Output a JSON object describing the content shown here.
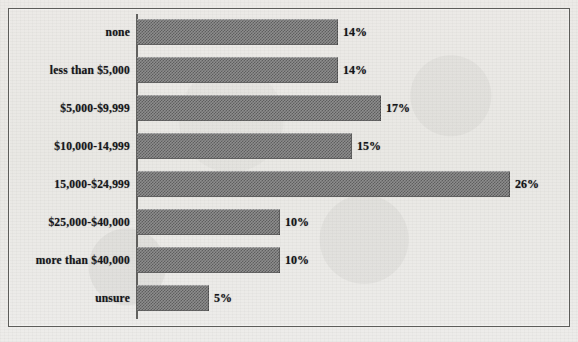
{
  "chart_data": {
    "type": "bar",
    "orientation": "horizontal",
    "title": "",
    "xlabel": "",
    "ylabel": "",
    "grid": false,
    "legend": null,
    "xlim": [
      0,
      26
    ],
    "value_suffix": "%",
    "categories": [
      "none",
      "less than $5,000",
      "$5,000-$9,999",
      "$10,000-14,999",
      "15,000-$24,999",
      "$25,000-$40,000",
      "more than $40,000",
      "unsure"
    ],
    "values": [
      14,
      14,
      17,
      15,
      26,
      10,
      10,
      5
    ],
    "value_labels": [
      "14%",
      "14%",
      "17%",
      "15%",
      "26%",
      "10%",
      "10%",
      "5%"
    ]
  },
  "style": {
    "paper_color": "#eae9e6",
    "frame_color": "#5d5d5a",
    "bar_fill": "#8d8d8d",
    "bar_dither": "#5e5e5e",
    "text_color": "#16161a",
    "axis_color": "#4a4a48"
  }
}
